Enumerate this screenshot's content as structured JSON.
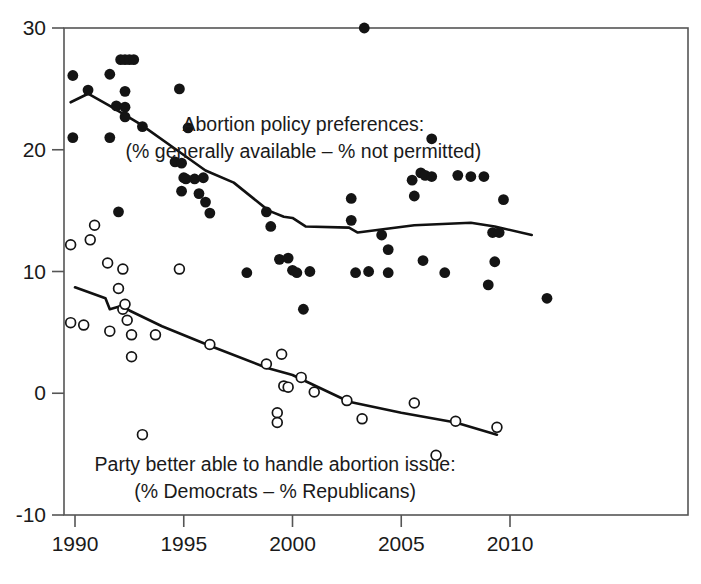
{
  "chart_data": {
    "type": "scatter",
    "title": "",
    "xlabel": "",
    "ylabel": "",
    "xlim": [
      1989.4,
      2012.2
    ],
    "ylim": [
      -11.5,
      31.5
    ],
    "xticks": [
      1990,
      1995,
      2000,
      2005,
      2010
    ],
    "xticklabels": [
      "1990",
      "1995",
      "2000",
      "2005",
      "2010"
    ],
    "yticks": [
      -10,
      0,
      10,
      20,
      30
    ],
    "yticklabels": [
      "-10",
      "0",
      "10",
      "20",
      "30"
    ],
    "grid": false,
    "legend": "none",
    "annotations": [
      {
        "name": "abortion-policy-annotation",
        "lines": [
          "Abortion policy preferences:",
          "(% generally available – % not permitted)"
        ],
        "x": 2000.5,
        "y": 21.5,
        "marker": "filled-circle"
      },
      {
        "name": "party-handle-annotation",
        "lines": [
          "Party better able to handle abortion issue:",
          "(% Democrats – % Republicans)"
        ],
        "x": 1999.2,
        "y": -6.4,
        "marker": "open-circle"
      }
    ],
    "series": [
      {
        "name": "Abortion policy preferences (% generally available – % not permitted)",
        "marker": "filled-circle",
        "color": "#141414",
        "points": [
          [
            1989.9,
            26.1
          ],
          [
            1989.9,
            21.0
          ],
          [
            1990.6,
            24.9
          ],
          [
            1991.6,
            26.2
          ],
          [
            1991.6,
            21.0
          ],
          [
            1991.9,
            23.6
          ],
          [
            1992.1,
            27.4
          ],
          [
            1992.3,
            27.4
          ],
          [
            1992.5,
            27.4
          ],
          [
            1992.7,
            27.4
          ],
          [
            1992.3,
            24.8
          ],
          [
            1992.3,
            23.5
          ],
          [
            1992.3,
            22.7
          ],
          [
            1992.0,
            14.9
          ],
          [
            1993.1,
            21.9
          ],
          [
            1994.8,
            25.0
          ],
          [
            1994.6,
            19.0
          ],
          [
            1994.9,
            18.9
          ],
          [
            1995.0,
            17.7
          ],
          [
            1995.2,
            21.8
          ],
          [
            1995.1,
            17.6
          ],
          [
            1994.9,
            16.6
          ],
          [
            1995.5,
            17.6
          ],
          [
            1995.7,
            16.4
          ],
          [
            1995.9,
            17.7
          ],
          [
            1996.0,
            15.7
          ],
          [
            1996.2,
            14.8
          ],
          [
            1997.9,
            9.9
          ],
          [
            1998.8,
            14.9
          ],
          [
            1999.0,
            13.7
          ],
          [
            1999.4,
            11.0
          ],
          [
            1999.8,
            11.1
          ],
          [
            2000.0,
            10.1
          ],
          [
            2000.2,
            9.9
          ],
          [
            2000.5,
            6.9
          ],
          [
            2000.8,
            10.0
          ],
          [
            2002.7,
            16.0
          ],
          [
            2002.7,
            14.2
          ],
          [
            2003.3,
            30.0
          ],
          [
            2002.9,
            9.9
          ],
          [
            2003.5,
            10.0
          ],
          [
            2004.1,
            13.0
          ],
          [
            2004.4,
            11.8
          ],
          [
            2004.4,
            9.9
          ],
          [
            2005.5,
            17.5
          ],
          [
            2005.6,
            16.2
          ],
          [
            2005.9,
            18.1
          ],
          [
            2006.1,
            17.9
          ],
          [
            2006.4,
            17.8
          ],
          [
            2006.4,
            20.9
          ],
          [
            2006.0,
            10.9
          ],
          [
            2007.0,
            9.9
          ],
          [
            2007.6,
            17.9
          ],
          [
            2008.2,
            17.8
          ],
          [
            2008.8,
            17.8
          ],
          [
            2009.0,
            8.9
          ],
          [
            2009.7,
            15.9
          ],
          [
            2009.3,
            10.8
          ],
          [
            2009.2,
            13.2
          ],
          [
            2009.5,
            13.2
          ],
          [
            2011.7,
            7.8
          ]
        ]
      },
      {
        "name": "Party better able to handle abortion issue (% Democrats – % Republicans)",
        "marker": "open-circle",
        "color": "#141414",
        "points": [
          [
            1989.8,
            12.2
          ],
          [
            1989.8,
            5.8
          ],
          [
            1990.4,
            5.6
          ],
          [
            1990.7,
            12.6
          ],
          [
            1990.9,
            13.8
          ],
          [
            1991.5,
            10.7
          ],
          [
            1991.6,
            5.1
          ],
          [
            1992.0,
            8.6
          ],
          [
            1992.2,
            6.9
          ],
          [
            1992.3,
            7.3
          ],
          [
            1992.4,
            6.0
          ],
          [
            1992.6,
            4.8
          ],
          [
            1992.2,
            10.2
          ],
          [
            1992.6,
            3.0
          ],
          [
            1993.1,
            -3.4
          ],
          [
            1993.7,
            4.8
          ],
          [
            1994.8,
            10.2
          ],
          [
            1996.2,
            4.0
          ],
          [
            1998.8,
            2.4
          ],
          [
            1999.5,
            3.2
          ],
          [
            1999.6,
            0.6
          ],
          [
            1999.8,
            0.5
          ],
          [
            1999.3,
            -1.6
          ],
          [
            1999.3,
            -2.4
          ],
          [
            2000.4,
            1.3
          ],
          [
            2001.0,
            0.1
          ],
          [
            2002.5,
            -0.6
          ],
          [
            2003.2,
            -2.1
          ],
          [
            2005.6,
            -0.8
          ],
          [
            2006.6,
            -5.1
          ],
          [
            2007.5,
            -2.3
          ],
          [
            2009.4,
            -2.8
          ]
        ]
      }
    ],
    "trend_lines": [
      {
        "name": "abortion-policy-trend",
        "series": "Abortion policy preferences (% generally available – % not permitted)",
        "points": [
          [
            1989.8,
            23.9
          ],
          [
            1990.6,
            24.6
          ],
          [
            1991.6,
            23.6
          ],
          [
            1993.0,
            22.1
          ],
          [
            1994.5,
            20.2
          ],
          [
            1996.0,
            18.3
          ],
          [
            1997.3,
            17.3
          ],
          [
            1998.9,
            15.0
          ],
          [
            1999.6,
            14.5
          ],
          [
            2000.0,
            14.4
          ],
          [
            2000.6,
            13.7
          ],
          [
            2002.6,
            13.6
          ],
          [
            2003.0,
            13.2
          ],
          [
            2005.6,
            13.8
          ],
          [
            2008.2,
            14.0
          ],
          [
            2009.3,
            13.7
          ],
          [
            2011.0,
            13.0
          ]
        ]
      },
      {
        "name": "party-handle-trend",
        "series": "Party better able to handle abortion issue (% Democrats – % Republicans)",
        "points": [
          [
            1990.0,
            8.7
          ],
          [
            1991.4,
            7.8
          ],
          [
            1991.6,
            6.9
          ],
          [
            1992.2,
            7.2
          ],
          [
            1992.5,
            6.8
          ],
          [
            1994.0,
            5.5
          ],
          [
            1996.2,
            3.9
          ],
          [
            1998.8,
            2.1
          ],
          [
            1999.8,
            1.6
          ],
          [
            2000.0,
            1.5
          ],
          [
            2002.6,
            -0.7
          ],
          [
            2005.0,
            -1.6
          ],
          [
            2007.5,
            -2.4
          ],
          [
            2009.4,
            -3.4
          ]
        ]
      }
    ]
  }
}
